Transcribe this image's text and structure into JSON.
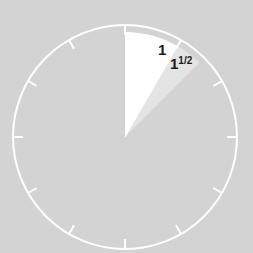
{
  "diagram": {
    "type": "clock-face",
    "center": [
      125,
      137
    ],
    "radius": 112,
    "tick_count": 12,
    "background_color": "#d3d3d3",
    "ring_color": "#ffffff",
    "sectors": [
      {
        "label": "1",
        "from_hour": 0,
        "to_hour": 1,
        "color": "#ffffff"
      },
      {
        "label": "1½",
        "from_hour": 1,
        "to_hour": 1.5,
        "color": "#e6e6e6"
      }
    ],
    "labels": {
      "one": "1",
      "one_half_whole": "1",
      "one_half_frac": "1/2"
    }
  }
}
